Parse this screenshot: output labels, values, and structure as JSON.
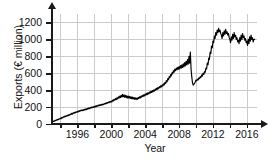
{
  "chart_data": {
    "type": "line",
    "title": "",
    "xlabel": "Year",
    "ylabel": "Exports (€ million)",
    "xlim": [
      1993.0,
      2017.2
    ],
    "ylim": [
      0,
      1300
    ],
    "yticks": [
      0,
      200,
      400,
      600,
      800,
      1000,
      1200
    ],
    "ytick_labels": [
      "0",
      "200",
      "400",
      "600",
      "800",
      "1000",
      "1200"
    ],
    "xticks": [
      1994,
      1996,
      1998,
      2000,
      2002,
      2004,
      2006,
      2008,
      2010,
      2012,
      2014,
      2016
    ],
    "xtick_labels": [
      "",
      "1996",
      "",
      "2000",
      "",
      "2004",
      "",
      "2008",
      "",
      "2012",
      "",
      "2016"
    ],
    "grid": true,
    "legend": null,
    "series_color": "#000000",
    "series": [
      {
        "name": "Exports",
        "x": [
          1993.0,
          1993.08,
          1993.17,
          1993.25,
          1993.33,
          1993.42,
          1993.5,
          1993.58,
          1993.67,
          1993.75,
          1993.83,
          1993.92,
          1994.0,
          1994.08,
          1994.17,
          1994.25,
          1994.33,
          1994.42,
          1994.5,
          1994.58,
          1994.67,
          1994.75,
          1994.83,
          1994.92,
          1995.0,
          1995.08,
          1995.17,
          1995.25,
          1995.33,
          1995.42,
          1995.5,
          1995.58,
          1995.67,
          1995.75,
          1995.83,
          1995.92,
          1996.0,
          1996.08,
          1996.17,
          1996.25,
          1996.33,
          1996.42,
          1996.5,
          1996.58,
          1996.67,
          1996.75,
          1996.83,
          1996.92,
          1997.0,
          1997.08,
          1997.17,
          1997.25,
          1997.33,
          1997.42,
          1997.5,
          1997.58,
          1997.67,
          1997.75,
          1997.83,
          1997.92,
          1998.0,
          1998.08,
          1998.17,
          1998.25,
          1998.33,
          1998.42,
          1998.5,
          1998.58,
          1998.67,
          1998.75,
          1998.83,
          1998.92,
          1999.0,
          1999.08,
          1999.17,
          1999.25,
          1999.33,
          1999.42,
          1999.5,
          1999.58,
          1999.67,
          1999.75,
          1999.83,
          1999.92,
          2000.0,
          2000.08,
          2000.17,
          2000.25,
          2000.33,
          2000.42,
          2000.5,
          2000.58,
          2000.67,
          2000.75,
          2000.83,
          2000.92,
          2001.0,
          2001.08,
          2001.17,
          2001.25,
          2001.33,
          2001.42,
          2001.5,
          2001.58,
          2001.67,
          2001.75,
          2001.83,
          2001.92,
          2002.0,
          2002.08,
          2002.17,
          2002.25,
          2002.33,
          2002.42,
          2002.5,
          2002.58,
          2002.67,
          2002.75,
          2002.83,
          2002.92,
          2003.0,
          2003.08,
          2003.17,
          2003.25,
          2003.33,
          2003.42,
          2003.5,
          2003.58,
          2003.67,
          2003.75,
          2003.83,
          2003.92,
          2004.0,
          2004.08,
          2004.17,
          2004.25,
          2004.33,
          2004.42,
          2004.5,
          2004.58,
          2004.67,
          2004.75,
          2004.83,
          2004.92,
          2005.0,
          2005.08,
          2005.17,
          2005.25,
          2005.33,
          2005.42,
          2005.5,
          2005.58,
          2005.67,
          2005.75,
          2005.83,
          2005.92,
          2006.0,
          2006.08,
          2006.17,
          2006.25,
          2006.33,
          2006.42,
          2006.5,
          2006.58,
          2006.67,
          2006.75,
          2006.83,
          2006.92,
          2007.0,
          2007.08,
          2007.17,
          2007.25,
          2007.33,
          2007.42,
          2007.5,
          2007.58,
          2007.67,
          2007.75,
          2007.83,
          2007.92,
          2008.0,
          2008.08,
          2008.17,
          2008.25,
          2008.33,
          2008.42,
          2008.5,
          2008.58,
          2008.67,
          2008.75,
          2008.83,
          2008.92,
          2009.0,
          2009.08,
          2009.17,
          2009.25,
          2009.33,
          2009.42,
          2009.5,
          2009.58,
          2009.67,
          2009.75,
          2009.83,
          2009.92,
          2010.0,
          2010.08,
          2010.17,
          2010.25,
          2010.33,
          2010.42,
          2010.5,
          2010.58,
          2010.67,
          2010.75,
          2010.83,
          2010.92,
          2011.0,
          2011.08,
          2011.17,
          2011.25,
          2011.33,
          2011.42,
          2011.5,
          2011.58,
          2011.67,
          2011.75,
          2011.83,
          2011.92,
          2012.0,
          2012.08,
          2012.17,
          2012.25,
          2012.33,
          2012.42,
          2012.5,
          2012.58,
          2012.67,
          2012.75,
          2012.83,
          2012.92,
          2013.0,
          2013.08,
          2013.17,
          2013.25,
          2013.33,
          2013.42,
          2013.5,
          2013.58,
          2013.67,
          2013.75,
          2013.83,
          2013.92,
          2014.0,
          2014.08,
          2014.17,
          2014.25,
          2014.33,
          2014.42,
          2014.5,
          2014.58,
          2014.67,
          2014.75,
          2014.83,
          2014.92,
          2015.0,
          2015.08,
          2015.17,
          2015.25,
          2015.33,
          2015.42,
          2015.5,
          2015.58,
          2015.67,
          2015.75,
          2015.83,
          2015.92,
          2016.0,
          2016.08,
          2016.17,
          2016.25,
          2016.33,
          2016.42,
          2016.5,
          2016.58,
          2016.67,
          2016.75,
          2016.83,
          2016.92
        ],
        "values": [
          20,
          26,
          34,
          30,
          42,
          38,
          50,
          44,
          56,
          52,
          62,
          58,
          70,
          64,
          78,
          72,
          86,
          80,
          92,
          86,
          98,
          92,
          104,
          98,
          110,
          104,
          118,
          112,
          126,
          118,
          132,
          126,
          138,
          132,
          144,
          138,
          150,
          142,
          156,
          150,
          162,
          154,
          166,
          158,
          170,
          162,
          174,
          166,
          178,
          170,
          184,
          176,
          190,
          182,
          196,
          188,
          200,
          192,
          204,
          196,
          208,
          200,
          214,
          206,
          220,
          212,
          224,
          216,
          228,
          220,
          232,
          224,
          236,
          228,
          242,
          234,
          248,
          240,
          254,
          246,
          260,
          252,
          266,
          258,
          272,
          262,
          282,
          272,
          292,
          282,
          300,
          288,
          310,
          296,
          320,
          306,
          330,
          312,
          340,
          318,
          350,
          322,
          344,
          316,
          338,
          312,
          334,
          308,
          330,
          306,
          326,
          302,
          322,
          298,
          318,
          296,
          314,
          292,
          310,
          288,
          306,
          292,
          314,
          300,
          322,
          308,
          330,
          316,
          338,
          324,
          346,
          332,
          354,
          340,
          362,
          348,
          370,
          356,
          378,
          364,
          386,
          372,
          394,
          380,
          402,
          388,
          412,
          398,
          422,
          408,
          432,
          418,
          442,
          428,
          452,
          438,
          462,
          448,
          476,
          462,
          492,
          478,
          512,
          498,
          536,
          522,
          560,
          546,
          584,
          568,
          608,
          592,
          630,
          612,
          648,
          630,
          660,
          640,
          670,
          648,
          678,
          652,
          690,
          660,
          700,
          668,
          712,
          676,
          726,
          686,
          742,
          698,
          760,
          706,
          800,
          720,
          850,
          640,
          560,
          490,
          460,
          470,
          480,
          500,
          520,
          510,
          530,
          520,
          545,
          535,
          560,
          550,
          580,
          565,
          600,
          585,
          620,
          610,
          660,
          650,
          720,
          700,
          780,
          760,
          850,
          830,
          920,
          900,
          980,
          960,
          1040,
          1010,
          1080,
          1050,
          1110,
          1080,
          1130,
          1090,
          1110,
          1070,
          1050,
          1010,
          1080,
          1040,
          1100,
          1060,
          1120,
          1070,
          1090,
          1050,
          1070,
          1020,
          1000,
          960,
          1030,
          990,
          1060,
          1010,
          1080,
          1030,
          1050,
          1000,
          1020,
          970,
          990,
          950,
          1020,
          980,
          1050,
          1000,
          1070,
          1020,
          1040,
          990,
          1010,
          960,
          980,
          930,
          1000,
          950,
          1030,
          980,
          1050,
          1000,
          1020,
          970,
          1000,
          1000
        ]
      }
    ]
  }
}
